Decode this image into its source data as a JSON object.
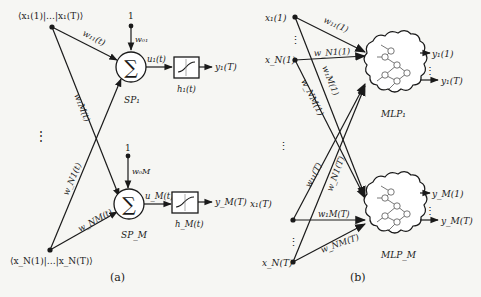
{
  "panel_a": {
    "caption": "(a)",
    "input_top_label": "⟨x₁(1)|…|x₁(T)⟩",
    "input_bottom_label": "⟨x_N(1)|…|x_N(T)⟩",
    "dots_vertical": "⋮",
    "units": [
      {
        "bias_value": "1",
        "bias_weight": "w₀₁",
        "node_symbol": "∑",
        "node_label": "SP₁",
        "net_label": "u₁(t)",
        "activation_label": "h₁(t)",
        "output_label": "y₁(T)",
        "weight_from_top": "w₁₁(t)",
        "weight_from_bottom": "w_N1(t)"
      },
      {
        "bias_value": "1",
        "bias_weight": "w₀M",
        "node_symbol": "∑",
        "node_label": "SP_M",
        "net_label": "u_M(t)",
        "activation_label": "h_M(t)",
        "output_label": "y_M(T)",
        "weight_from_top": "w₁M(t)",
        "weight_from_bottom": "w_NM(t)"
      }
    ]
  },
  "panel_b": {
    "caption": "(b)",
    "inputs_time_1": [
      "x₁(1)",
      "x_N(1)"
    ],
    "inputs_time_T": [
      "x₁(T)",
      "x_N(T)"
    ],
    "dots_vertical": "⋮",
    "weights_time_1": [
      "w₁₁(1)",
      "w_N1(1)",
      "w₁M(1)",
      "w_NM(1)"
    ],
    "weights_time_T": [
      "w₁₁(T)",
      "w_N1(T)",
      "w₁M(T)",
      "w_NM(T)"
    ],
    "mlps": [
      {
        "label": "MLP₁",
        "outputs": [
          "y₁(1)",
          "y₁(T)"
        ]
      },
      {
        "label": "MLP_M",
        "outputs": [
          "y_M(1)",
          "y_M(T)"
        ]
      }
    ]
  }
}
